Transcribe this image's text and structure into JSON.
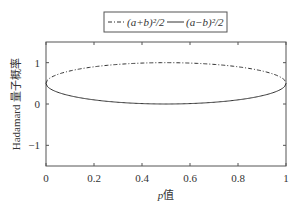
{
  "chart_data": {
    "type": "line",
    "title": "",
    "xlabel": "p值",
    "xlabel_italic_part": "p",
    "xlabel_rest": "值",
    "ylabel": "Hadamard 量子概率",
    "xlim": [
      0,
      1
    ],
    "ylim": [
      -1.5,
      1.5
    ],
    "xticks": [
      0,
      0.2,
      0.4,
      0.6,
      0.8,
      1
    ],
    "xtick_labels": [
      "0",
      "0.2",
      "0.4",
      "0.6",
      "0.8",
      "1"
    ],
    "yticks": [
      -1,
      0,
      1
    ],
    "ytick_labels": [
      "−1",
      "0",
      "1"
    ],
    "grid": false,
    "legend_position": "top-center (outside)",
    "x": [
      0,
      0.05,
      0.1,
      0.15,
      0.2,
      0.25,
      0.3,
      0.35,
      0.4,
      0.45,
      0.5,
      0.55,
      0.6,
      0.65,
      0.7,
      0.75,
      0.8,
      0.85,
      0.9,
      0.95,
      1
    ],
    "series": [
      {
        "name": "(a+b)^2/2",
        "style": "dash-dot",
        "values": [
          0.5,
          0.718,
          0.8,
          0.857,
          0.9,
          0.933,
          0.958,
          0.977,
          0.99,
          0.997,
          1.0,
          0.997,
          0.99,
          0.977,
          0.958,
          0.933,
          0.9,
          0.857,
          0.8,
          0.718,
          0.5
        ]
      },
      {
        "name": "(a-b)^2/2",
        "style": "solid",
        "values": [
          0.5,
          0.282,
          0.2,
          0.143,
          0.1,
          0.067,
          0.042,
          0.023,
          0.01,
          0.003,
          0.0,
          0.003,
          0.01,
          0.023,
          0.042,
          0.067,
          0.1,
          0.143,
          0.2,
          0.282,
          0.5
        ]
      }
    ]
  },
  "legend": {
    "entry1_label": "(a+b)²/2",
    "entry2_label": "(a−b)²/2"
  },
  "colors": {
    "axis": "#555555",
    "line": "#333333",
    "background": "#ffffff"
  }
}
